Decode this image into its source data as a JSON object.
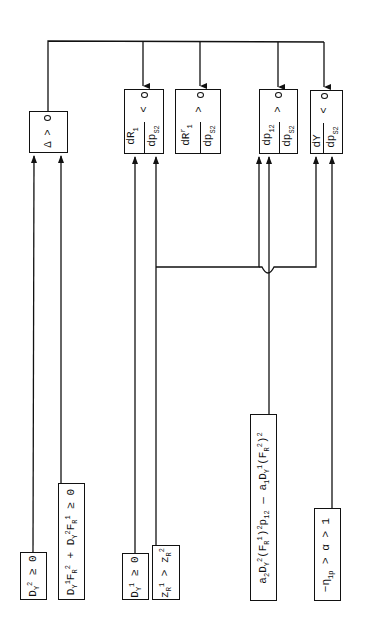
{
  "diagram": {
    "type": "logic block diagram (rotated 90°)",
    "decision_boxes": [
      {
        "id": "delta",
        "label": "Δ",
        "comparator": ">",
        "inputs_from": [
          "dy2",
          "dyf"
        ]
      },
      {
        "id": "dR1",
        "numerator": "dR",
        "numerator_sub": "1",
        "denominator": "dp",
        "denominator_sub": "S2",
        "comparator": "<"
      },
      {
        "id": "dRr",
        "numerator": "dR",
        "numerator_sup": "r",
        "numerator_sub": "1",
        "denominator": "dp",
        "denominator_sub": "S2",
        "comparator": ">"
      },
      {
        "id": "dp12",
        "numerator": "dp",
        "numerator_sub": "12",
        "denominator": "dp",
        "denominator_sub": "S2",
        "comparator": ">"
      },
      {
        "id": "dY",
        "numerator": "dY",
        "denominator": "dp",
        "denominator_sub": "S2",
        "comparator": "<"
      }
    ],
    "condition_boxes": [
      {
        "id": "dy2",
        "text": "D_Y^2 ≥ 0"
      },
      {
        "id": "dyf",
        "text": "D_Y^1 F_R^2 + D_Y^2 F_R^1 ≥ 0"
      },
      {
        "id": "dy1",
        "text": "D_Y^1 ≥ 0"
      },
      {
        "id": "z",
        "text": "z_R^1 > z_R^2"
      },
      {
        "id": "a",
        "text": "a_2 D_Y^2 (F_R^1)^2 p_12 − a_1 D_Y^1 (F_R^2)^2"
      },
      {
        "id": "eta",
        "text": "−η_1p > α > 1"
      }
    ],
    "labels": {
      "delta": "Δ",
      "gt": ">",
      "lt": "<",
      "ge": "≥",
      "dR": "dR",
      "dp": "dp",
      "dY": "dY",
      "s2": "S2",
      "one": "1",
      "two": "2",
      "r": "r",
      "twelve": "12",
      "zero": "0"
    },
    "texts": {
      "dy2": "D",
      "dy2_sup": "2",
      "dy2_sub": "Y",
      "dy2_rel": " ≥ 0",
      "dyf_html": "D<sub>Y</sub><sup>1</sup>F<sub>R</sub><sup>2</sup> + D<sub>Y</sub><sup>2</sup>F<sub>R</sub><sup>1</sup> ≥ 0",
      "dy1_rel": " ≥ 0",
      "z_rel": " > ",
      "a_html": "a<sub>2</sub>D<sub>Y</sub><sup>2</sup>(F<sub>R</sub><sup>1</sup>)<sup>2</sup>p<sub>12</sub> — a<sub>1</sub>D<sub>Y</sub><sup>1</sup>(F<sub>R</sub><sup>2</sup>)<sup>2</sup>",
      "eta_html": "−η<sub>1p</sub> > α > 1"
    },
    "colors": {
      "line": "#111111",
      "background": "#ffffff"
    }
  }
}
